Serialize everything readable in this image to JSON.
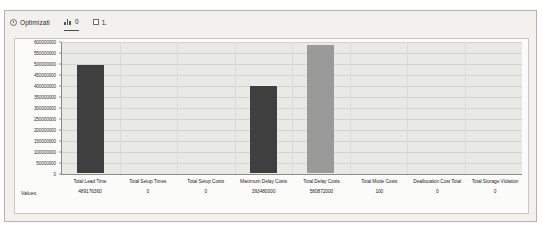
{
  "toolbar": {
    "items": [
      {
        "label": "Optimizati",
        "icon": "gear-icon",
        "name": "optimization-button"
      },
      {
        "label": "0",
        "icon": "chart-icon",
        "name": "chart-toggle-button"
      },
      {
        "label": "1.",
        "icon": "checkbox-icon",
        "name": "option-checkbox"
      }
    ]
  },
  "table": {
    "values_row_label": "Values:"
  },
  "chart_data": {
    "type": "bar",
    "title": "",
    "xlabel": "",
    "ylabel": "",
    "ylim": [
      0,
      600000000
    ],
    "grid": true,
    "legend": "none",
    "categories": [
      "Total Lead Time",
      "Total Setup Times",
      "Total Setup Costs",
      "Maximum Delay Costs",
      "Total Delay Costs",
      "Total Mode Costs",
      "Deallocation Cost Total",
      "Total Storage Violation"
    ],
    "values": [
      489176360,
      0,
      0,
      393480000,
      580872000,
      100,
      0,
      0
    ],
    "value_labels": [
      "489176360",
      "0",
      "0",
      "393480000",
      "580872000",
      "100",
      "0",
      "0"
    ],
    "bar_colors": [
      "#3f3f3f",
      "#3f3f3f",
      "#3f3f3f",
      "#3f3f3f",
      "#9a9a9a",
      "#9a9a9a",
      "#9a9a9a",
      "#9a9a9a"
    ],
    "ytick_labels": [
      "600000000",
      "550000000",
      "500000000",
      "450000000",
      "400000000",
      "350000000",
      "300000000",
      "250000000",
      "200000000",
      "150000000",
      "100000000",
      "50000000",
      "0"
    ],
    "ytick_values": [
      600000000,
      550000000,
      500000000,
      450000000,
      400000000,
      350000000,
      300000000,
      250000000,
      200000000,
      150000000,
      100000000,
      50000000,
      0
    ]
  },
  "colors": {
    "panel_bg": "#f2f1ee",
    "plot_bg": "#e9e9e6",
    "bar_dark": "#3f3f3f",
    "bar_light": "#9a9a9a",
    "gridline": "#d2d2ce"
  }
}
